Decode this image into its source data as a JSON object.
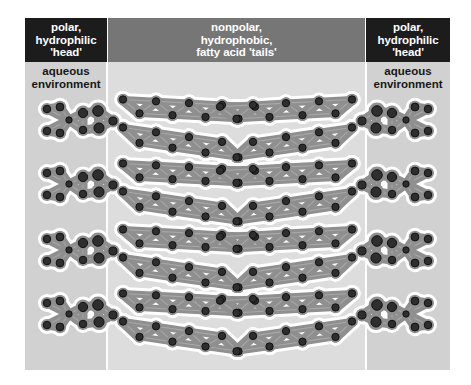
{
  "figure": {
    "background_color": "#d3d3d3",
    "columns": [
      {
        "name": "left-aqueous-column",
        "color": "#d1d1d1"
      },
      {
        "name": "center-hydrophobic-column",
        "color": "#dddddd"
      },
      {
        "name": "right-aqueous-column",
        "color": "#d1d1d1"
      }
    ]
  },
  "headers": {
    "left": {
      "label": "polar,\nhydrophilic\n'head'",
      "line1": "polar,",
      "line2": "hydrophilic",
      "line3": "'head'",
      "background_color": "#1c1c1c",
      "text_color": "#ffffff"
    },
    "center": {
      "label": "nonpolar,\nhydrophobic,\nfatty acid 'tails'",
      "line1": "nonpolar,",
      "line2": "hydrophobic,",
      "line3": "fatty acid 'tails'",
      "background_color": "#767676",
      "text_color": "#ffffff"
    },
    "right": {
      "label": "polar,\nhydrophilic\n'head'",
      "line1": "polar,",
      "line2": "hydrophilic",
      "line3": "'head'",
      "background_color": "#1c1c1c",
      "text_color": "#ffffff"
    }
  },
  "aqueous_labels": {
    "left": {
      "line1": "aqueous",
      "line2": "environment",
      "text_color": "#171717"
    },
    "right": {
      "line1": "aqueous",
      "line2": "environment",
      "text_color": "#171717"
    }
  },
  "molecule_style": {
    "atom_fill": "#2e2e2e",
    "atom_stroke": "#111111",
    "body_fill": "#8f8f8f",
    "body_highlight": "#a8a8a8",
    "outline": "#ffffff",
    "outline_width": 3
  },
  "phospholipids": {
    "rows": 4,
    "left_leaflet_count": 4,
    "right_leaflet_count": 4,
    "row_y": [
      82,
      146,
      212,
      276
    ],
    "tail_carbons_per_chain": 8,
    "description": "Space-filling phospholipid molecules arranged as a bilayer: polar head groups face the aqueous environment on both outer edges, nonpolar fatty acid tails interdigitate in the central hydrophobic core."
  }
}
